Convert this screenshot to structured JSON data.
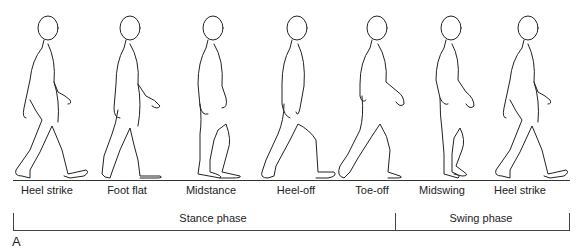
{
  "diagram": {
    "figure_label": "A",
    "events": [
      {
        "label": "Heel strike",
        "x": 47
      },
      {
        "label": "Foot flat",
        "x": 127
      },
      {
        "label": "Midstance",
        "x": 211
      },
      {
        "label": "Heel-off",
        "x": 296
      },
      {
        "label": "Toe-off",
        "x": 372
      },
      {
        "label": "Midswing",
        "x": 442
      },
      {
        "label": "Heel strike",
        "x": 520
      }
    ],
    "phases": [
      {
        "label": "Stance phase",
        "x_start": 13,
        "x_end": 395
      },
      {
        "label": "Swing phase",
        "x_start": 395,
        "x_end": 569
      }
    ],
    "colors": {
      "line": "#333333",
      "background": "#ffffff"
    }
  }
}
